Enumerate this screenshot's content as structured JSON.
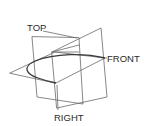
{
  "diagram": {
    "labels": {
      "top": "TOP",
      "front": "FRONT",
      "right": "RIGHT"
    },
    "colors": {
      "background": "#ffffff",
      "edge": "#6a6a6a",
      "curve": "#3a3a3a",
      "text": "#2a2a2a"
    },
    "planes": [
      {
        "name": "top-plane",
        "points": "10,73 55,52 105,58 56,83"
      },
      {
        "name": "right-plane",
        "points": "32,37 37,97 83,104 79,38"
      },
      {
        "name": "front-plane",
        "points": "52,52 101,28 107,97 57,108"
      }
    ],
    "inner_lines": [
      {
        "name": "inner-top-edge",
        "d": "M52,52 L79,52"
      },
      {
        "name": "inner-diagonal",
        "d": "M52,52 L79,45"
      }
    ],
    "curve": {
      "name": "elliptical-section-curve",
      "d": "M105,58 C85,53 55,53 35,61 C22,67 26,74 38,78 C46,81 51,82 56,83"
    },
    "leaders": [
      {
        "name": "top-leader",
        "d": "M43,31 L77,38"
      },
      {
        "name": "front-leader",
        "d": "M104,58 L107,58"
      },
      {
        "name": "right-leader",
        "d": "M57,85 L58,110"
      }
    ],
    "label_positions": {
      "top": {
        "x": 27,
        "y": 31
      },
      "front": {
        "x": 107,
        "y": 62
      },
      "right": {
        "x": 54,
        "y": 121
      }
    }
  }
}
